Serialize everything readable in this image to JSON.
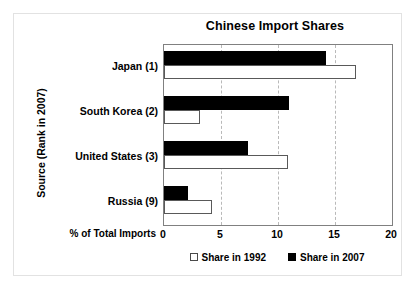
{
  "chart_data": {
    "type": "bar",
    "orientation": "horizontal",
    "title": "Chinese Import Shares",
    "xlabel": "% of Total Imports",
    "ylabel": "Source (Rank in 2007)",
    "categories": [
      "Japan (1)",
      "South Korea (2)",
      "United States (3)",
      "Russia (9)"
    ],
    "series": [
      {
        "name": "Share in 1992",
        "values": [
          16.8,
          3.2,
          10.9,
          4.2
        ]
      },
      {
        "name": "Share in 2007",
        "values": [
          14.2,
          11.0,
          7.4,
          2.1
        ]
      }
    ],
    "xlim": [
      0,
      20
    ],
    "xticks": [
      0,
      5,
      10,
      15,
      20
    ],
    "xtick_labels": [
      "0",
      "5",
      "10",
      "15",
      "20"
    ],
    "grid": true,
    "grid_axis": "x",
    "grid_style": "dashed",
    "legend_position": "bottom-center",
    "colors": {
      "series_1992_fill": "#ffffff",
      "series_1992_edge": "#595959",
      "series_2007_fill": "#000000",
      "plot_border": "#808080",
      "gridline": "#b9b9b9",
      "text": "#000000",
      "background": "#ffffff"
    }
  }
}
